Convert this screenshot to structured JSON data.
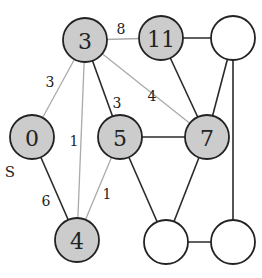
{
  "colors": {
    "visited_fill": "#cccccc",
    "unvisited_fill": "#ffffff",
    "node_stroke": "#222222",
    "tree_edge": "#2a2a2a",
    "relaxed_edge": "#aaaaaa",
    "text": "#222222"
  },
  "source_label": "S",
  "nodes": [
    {
      "id": "n3",
      "label": "3",
      "x": 85,
      "y": 40,
      "visited": true
    },
    {
      "id": "n11",
      "label": "11",
      "x": 161,
      "y": 38,
      "visited": true
    },
    {
      "id": "nTR",
      "label": "",
      "x": 233,
      "y": 38,
      "visited": false
    },
    {
      "id": "n0",
      "label": "0",
      "x": 32,
      "y": 137,
      "visited": true
    },
    {
      "id": "n5",
      "label": "5",
      "x": 120,
      "y": 137,
      "visited": true
    },
    {
      "id": "n7",
      "label": "7",
      "x": 207,
      "y": 137,
      "visited": true
    },
    {
      "id": "n4",
      "label": "4",
      "x": 77,
      "y": 240,
      "visited": true
    },
    {
      "id": "nBM",
      "label": "",
      "x": 166,
      "y": 242,
      "visited": false
    },
    {
      "id": "nBR",
      "label": "",
      "x": 233,
      "y": 242,
      "visited": false
    }
  ],
  "edges": [
    {
      "from": "n3",
      "to": "n0",
      "style": "light",
      "weight": "3",
      "lx": 50,
      "ly": 82
    },
    {
      "from": "n3",
      "to": "n4",
      "style": "light",
      "weight": "1",
      "lx": 74,
      "ly": 141
    },
    {
      "from": "n3",
      "to": "n5",
      "style": "dark",
      "weight": "3",
      "lx": 117,
      "ly": 103
    },
    {
      "from": "n3",
      "to": "n7",
      "style": "light",
      "weight": "4",
      "lx": 152,
      "ly": 96
    },
    {
      "from": "n3",
      "to": "n11",
      "style": "light",
      "weight": "8",
      "lx": 121,
      "ly": 29
    },
    {
      "from": "n0",
      "to": "n4",
      "style": "dark",
      "weight": "6",
      "lx": 46,
      "ly": 201
    },
    {
      "from": "n5",
      "to": "n4",
      "style": "light",
      "weight": "1",
      "lx": 107,
      "ly": 194
    },
    {
      "from": "n5",
      "to": "n7",
      "style": "dark",
      "weight": "",
      "lx": 0,
      "ly": 0
    },
    {
      "from": "n5",
      "to": "nBM",
      "style": "dark",
      "weight": "",
      "lx": 0,
      "ly": 0
    },
    {
      "from": "n11",
      "to": "n7",
      "style": "dark",
      "weight": "",
      "lx": 0,
      "ly": 0
    },
    {
      "from": "n11",
      "to": "nTR",
      "style": "dark",
      "weight": "",
      "lx": 0,
      "ly": 0
    },
    {
      "from": "nTR",
      "to": "n7",
      "style": "dark",
      "weight": "",
      "lx": 0,
      "ly": 0
    },
    {
      "from": "nTR",
      "to": "nBR",
      "style": "dark",
      "weight": "",
      "lx": 0,
      "ly": 0
    },
    {
      "from": "n7",
      "to": "nBM",
      "style": "dark",
      "weight": "",
      "lx": 0,
      "ly": 0
    },
    {
      "from": "nBM",
      "to": "nBR",
      "style": "dark",
      "weight": "",
      "lx": 0,
      "ly": 0
    }
  ],
  "source_label_pos": {
    "x": 10,
    "y": 172
  },
  "node_radius": 22
}
